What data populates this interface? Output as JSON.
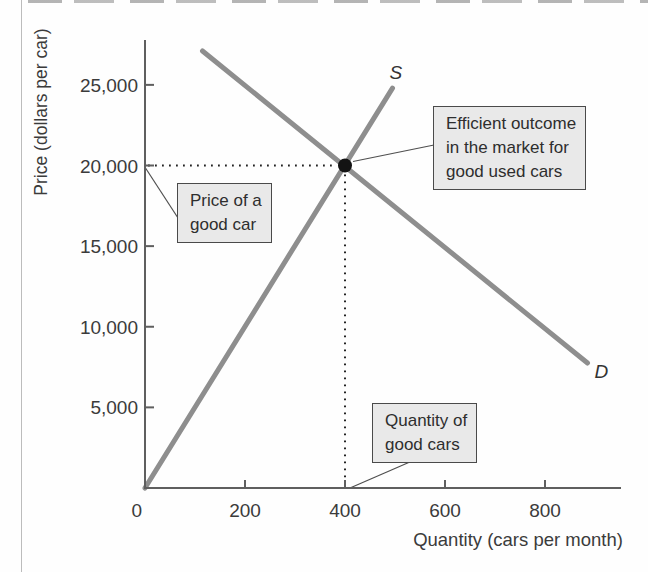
{
  "figure": {
    "callouts": {
      "efficient": {
        "lines": [
          "Efficient outcome",
          "in the market for",
          "good used cars"
        ],
        "full_text": "Efficient outcome in the market for good used cars"
      },
      "price": {
        "lines": [
          "Price of a",
          "good car"
        ],
        "full_text": "Price of a good car"
      },
      "quantity": {
        "lines": [
          "Quantity of",
          "good cars"
        ],
        "full_text": "Quantity of good cars"
      }
    },
    "colors": {
      "curve": "#8e8e8e",
      "axis": "#5f5f5f",
      "tick_text": "#3b3b3b",
      "dot": "#131313",
      "dotted_guide": "#222222",
      "leader_line": "#4f4f4f",
      "callout_bg": "#e9e9e9",
      "callout_border": "#4a4a4a"
    }
  },
  "chart_data": {
    "type": "line",
    "title": "",
    "xlabel": "Quantity (cars per month)",
    "ylabel": "Price (dollars per car)",
    "xlim": [
      0,
      950
    ],
    "ylim": [
      0,
      27900
    ],
    "x_ticks": [
      0,
      200,
      400,
      600,
      800
    ],
    "y_ticks": [
      5000,
      10000,
      15000,
      20000,
      25000
    ],
    "grid": false,
    "legend": "none - curves labeled inline",
    "series": [
      {
        "name": "S",
        "role": "supply",
        "points": [
          [
            0,
            0
          ],
          [
            495,
            24800
          ]
        ]
      },
      {
        "name": "D",
        "role": "demand",
        "points": [
          [
            115,
            27100
          ],
          [
            885,
            7750
          ]
        ]
      }
    ],
    "equilibrium": {
      "quantity": 400,
      "price": 20000
    },
    "annotations": [
      {
        "text": "Efficient outcome in the market for good used cars",
        "target": "equilibrium point (400, 20,000)"
      },
      {
        "text": "Price of a good car",
        "target": "y-axis at 20,000"
      },
      {
        "text": "Quantity of good cars",
        "target": "x-axis at 400"
      }
    ]
  }
}
